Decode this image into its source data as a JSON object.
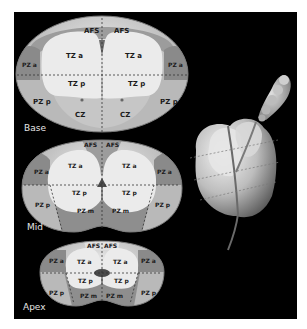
{
  "figure": {
    "background_color": "#000000",
    "page_color": "#ffffff",
    "zone_colors": {
      "TZ": "#ebebeb",
      "AFS": "#9c9c9c",
      "PZ_a": "#8a8a8a",
      "PZ_p": "#b9b9b9",
      "PZ_m": "#8e8e8e",
      "CZ": "#c6c6c6",
      "capsule": "#d0d0d0"
    }
  },
  "slices": {
    "base": {
      "label": "Base",
      "zones": {
        "afs_left": "AFS",
        "afs_right": "AFS",
        "tza_left": "TZ a",
        "tza_right": "TZ a",
        "tzp_left": "TZ p",
        "tzp_right": "TZ p",
        "pza_left": "PZ a",
        "pza_right": "PZ a",
        "pzp_left": "PZ p",
        "pzp_right": "PZ p",
        "cz_left": "CZ",
        "cz_right": "CZ"
      }
    },
    "mid": {
      "label": "Mid",
      "zones": {
        "afs_left": "AFS",
        "afs_right": "AFS",
        "tza_left": "TZ a",
        "tza_right": "TZ a",
        "tzp_left": "TZ p",
        "tzp_right": "TZ p",
        "pza_left": "PZ a",
        "pza_right": "PZ a",
        "pzp_left": "PZ p",
        "pzp_right": "PZ p",
        "pzm_left": "PZ m",
        "pzm_right": "PZ m"
      }
    },
    "apex": {
      "label": "Apex",
      "zones": {
        "afs_left": "AFS",
        "afs_right": "AFS",
        "tza_left": "TZ a",
        "tza_right": "TZ a",
        "tzp_left": "TZ p",
        "tzp_right": "TZ p",
        "pza_left": "PZ a",
        "pza_right": "PZ a",
        "pzp_left": "PZ p",
        "pzp_right": "PZ p",
        "pzm_left": "PZ m",
        "pzm_right": "PZ m"
      }
    }
  },
  "illustration": {
    "name": "3D prostate with seminal vesicle",
    "section_planes": 3
  }
}
